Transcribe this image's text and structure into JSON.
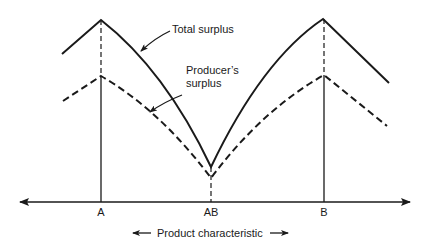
{
  "diagram": {
    "curves": {
      "total_surplus_label": "Total surplus",
      "producer_surplus_label_line1": "Producer’s",
      "producer_surplus_label_line2": "surplus"
    },
    "axis": {
      "ticks": [
        {
          "label": "A",
          "x": 101
        },
        {
          "label": "AB",
          "x": 212
        },
        {
          "label": "B",
          "x": 324
        }
      ],
      "label": "Product characteristic",
      "left_arrow": "←",
      "right_arrow": "→"
    },
    "colors": {
      "ink": "#1a1a1a",
      "background": "#ffffff"
    }
  }
}
